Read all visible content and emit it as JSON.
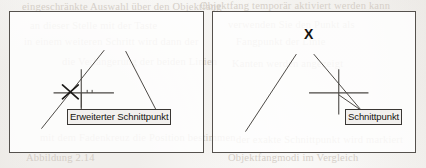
{
  "figure": {
    "kind": "technical-illustration",
    "panel_count": 2,
    "ink_color": "#4a4743",
    "frame_color": "#55514d",
    "callout_fill": "#f2f0ee",
    "callout_border": "#3a3734",
    "background_color": "#fdfdfc"
  },
  "panels": [
    {
      "id": "left",
      "name": "extended-intersection-panel",
      "callout": {
        "label": "Erweiterter Schnittpunkt",
        "name": "callout-extended-intersection"
      },
      "marker": {
        "glyph": "X",
        "name": "marker-x-left",
        "description": "x-snap-marker at extended intersection"
      },
      "crosshair": {
        "name": "crosshair-left",
        "description": "aperture crosshair right of the snap marker"
      },
      "geometry_lines": [
        {
          "name": "line-ascending-left",
          "x1": 32,
          "y1": 118,
          "x2": 95,
          "y2": 39
        },
        {
          "name": "line-descending-left",
          "x1": 117,
          "y1": 40,
          "x2": 150,
          "y2": 104
        }
      ],
      "extension_lines": [
        {
          "name": "extension-line-ascending",
          "x1": 95,
          "y1": 39,
          "x2": 62,
          "y2": 81
        }
      ]
    },
    {
      "id": "right",
      "name": "intersection-panel",
      "callout": {
        "label": "Schnittpunkt",
        "name": "callout-intersection"
      },
      "marker": {
        "glyph": "X",
        "name": "marker-x-right",
        "description": "bold x cursor marker above the lines"
      },
      "crosshair": {
        "name": "crosshair-right",
        "description": "aperture crosshair on the real intersection"
      },
      "geometry_lines": [
        {
          "name": "line-ascending-right",
          "x1": 33,
          "y1": 121,
          "x2": 84,
          "y2": 43
        },
        {
          "name": "line-descending-right",
          "x1": 102,
          "y1": 43,
          "x2": 150,
          "y2": 100
        }
      ]
    }
  ],
  "bleed_text": [
    {
      "text": "eingeschränkte Auswahl über den Objektfang",
      "x": 22,
      "y": 1
    },
    {
      "text": "Objektfang temporär aktiviert werden kann",
      "x": 200,
      "y": 0
    },
    {
      "text": "an dieser Stelle mit der Taste",
      "x": 30,
      "y": 20
    },
    {
      "text": "verwenden Sie den Punkt als",
      "x": 228,
      "y": 19
    },
    {
      "text": "in einem weiteren Schritt wird dann der",
      "x": 24,
      "y": 36
    },
    {
      "text": "Fangpunkt der Linie",
      "x": 236,
      "y": 36
    },
    {
      "text": "die Verlängerung der beiden Linien",
      "x": 62,
      "y": 56
    },
    {
      "text": "Kanten werden angezeigt",
      "x": 232,
      "y": 58
    },
    {
      "text": "mit dem Fadenkreuz die Position bestimmen",
      "x": 40,
      "y": 132
    },
    {
      "text": "der exakte Schnittpunkt wird markiert",
      "x": 236,
      "y": 134
    },
    {
      "text": "Abbildung 2.14",
      "x": 26,
      "y": 152
    },
    {
      "text": "Objektfangmodi im Vergleich",
      "x": 228,
      "y": 152
    }
  ]
}
